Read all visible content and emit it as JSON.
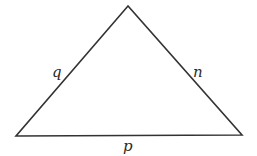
{
  "diagram": {
    "type": "triangle",
    "vertices": {
      "top": [
        128,
        6
      ],
      "bottom_left": [
        16,
        136
      ],
      "bottom_right": [
        242,
        135
      ]
    },
    "side_labels": {
      "left": "q",
      "right": "n",
      "bottom": "p"
    },
    "stroke_color": "#333333"
  }
}
